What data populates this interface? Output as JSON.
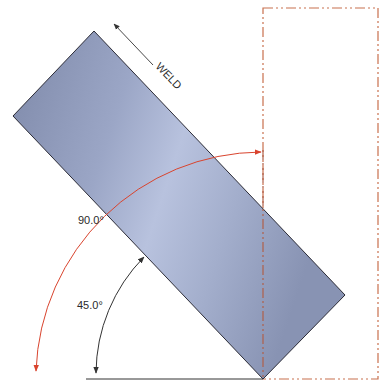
{
  "diagram": {
    "weld_label": "WELD",
    "angle_small_label": "45.0°",
    "angle_large_label": "90.0°",
    "colors": {
      "plate_fill_dark": "#8590b0",
      "plate_fill_light": "#b4bedb",
      "plate_stroke": "#2b2b36",
      "phantom_line": "#c8704e",
      "red_arc": "#d9442e",
      "black_arc": "#333333",
      "baseline": "#333333"
    }
  }
}
